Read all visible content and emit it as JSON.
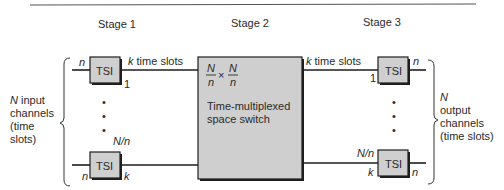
{
  "stages": [
    "Stage 1",
    "Stage 2",
    "Stage 3"
  ],
  "input_side": {
    "label_lines": [
      {
        "italic": "N",
        "rest": " input"
      },
      {
        "italic": "",
        "rest": "channels"
      },
      {
        "italic": "",
        "rest": "(time"
      },
      {
        "italic": "",
        "rest": "slots)"
      }
    ]
  },
  "output_side": {
    "label_lines": [
      {
        "italic": "N",
        "rest": ""
      },
      {
        "italic": "",
        "rest": "output"
      },
      {
        "italic": "",
        "rest": "channels"
      },
      {
        "italic": "",
        "rest": "(time slots)"
      }
    ]
  },
  "stage1": {
    "top_tsi": {
      "label": "TSI",
      "in_label": "n",
      "out_label": "1"
    },
    "bottom_tsi": {
      "label": "TSI",
      "in_label": "n",
      "out_label": "k",
      "index_label": "N/n"
    },
    "link_label_italic": "k",
    "link_label_rest": " time slots"
  },
  "stage2": {
    "fraction_num": "N",
    "fraction_den": "n",
    "times": "×",
    "title_line1": "Time-multiplexed",
    "title_line2": "space switch"
  },
  "stage3": {
    "top_tsi": {
      "label": "TSI",
      "in_label": "1",
      "out_label": "n"
    },
    "bottom_tsi": {
      "label": "TSI",
      "in_label": "k",
      "out_label": "n",
      "index_label": "N/n"
    },
    "link_label_italic": "k",
    "link_label_rest": " time slots"
  },
  "ellipsis": "•"
}
